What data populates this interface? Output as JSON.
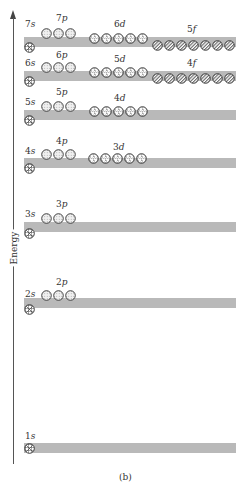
{
  "axis": {
    "label": "Energy",
    "arrow": "arrow-up-icon"
  },
  "caption": "(b)",
  "colors": {
    "band": "#b9b9b9",
    "stroke": "#333333",
    "axis": "#555555"
  },
  "shells": [
    {
      "n": 7,
      "band_top": 37,
      "subshells": [
        {
          "name": "7s",
          "n": "7",
          "l": "s",
          "count": 1,
          "x": 24,
          "y": 42,
          "label_x": 25,
          "label_y": 20
        },
        {
          "name": "7p",
          "n": "7",
          "l": "p",
          "count": 3,
          "x": 41,
          "y": 28,
          "label_x": 56,
          "label_y": 14
        },
        {
          "name": "6d",
          "n": "6",
          "l": "d",
          "count": 5,
          "x": 89,
          "y": 33,
          "label_x": 114,
          "label_y": 20
        },
        {
          "name": "5f",
          "n": "5",
          "l": "f",
          "count": 7,
          "x": 152,
          "y": 40,
          "label_x": 187,
          "label_y": 25
        }
      ]
    },
    {
      "n": 6,
      "band_top": 71,
      "subshells": [
        {
          "name": "6s",
          "n": "6",
          "l": "s",
          "count": 1,
          "x": 24,
          "y": 76,
          "label_x": 25,
          "label_y": 59
        },
        {
          "name": "6p",
          "n": "6",
          "l": "p",
          "count": 3,
          "x": 41,
          "y": 62,
          "label_x": 56,
          "label_y": 51
        },
        {
          "name": "5d",
          "n": "5",
          "l": "d",
          "count": 5,
          "x": 89,
          "y": 67,
          "label_x": 114,
          "label_y": 55
        },
        {
          "name": "4f",
          "n": "4",
          "l": "f",
          "count": 7,
          "x": 152,
          "y": 73,
          "label_x": 187,
          "label_y": 59
        }
      ]
    },
    {
      "n": 5,
      "band_top": 110,
      "subshells": [
        {
          "name": "5s",
          "n": "5",
          "l": "s",
          "count": 1,
          "x": 24,
          "y": 115,
          "label_x": 25,
          "label_y": 98
        },
        {
          "name": "5p",
          "n": "5",
          "l": "p",
          "count": 3,
          "x": 41,
          "y": 101,
          "label_x": 56,
          "label_y": 88
        },
        {
          "name": "4d",
          "n": "4",
          "l": "d",
          "count": 5,
          "x": 89,
          "y": 106,
          "label_x": 114,
          "label_y": 94
        }
      ]
    },
    {
      "n": 4,
      "band_top": 158,
      "subshells": [
        {
          "name": "4s",
          "n": "4",
          "l": "s",
          "count": 1,
          "x": 24,
          "y": 163,
          "label_x": 25,
          "label_y": 147
        },
        {
          "name": "4p",
          "n": "4",
          "l": "p",
          "count": 3,
          "x": 41,
          "y": 149,
          "label_x": 56,
          "label_y": 137
        },
        {
          "name": "3d",
          "n": "3",
          "l": "d",
          "count": 5,
          "x": 88,
          "y": 153,
          "label_x": 113,
          "label_y": 143
        }
      ]
    },
    {
      "n": 3,
      "band_top": 222,
      "subshells": [
        {
          "name": "3s",
          "n": "3",
          "l": "s",
          "count": 1,
          "x": 24,
          "y": 228,
          "label_x": 25,
          "label_y": 210
        },
        {
          "name": "3p",
          "n": "3",
          "l": "p",
          "count": 3,
          "x": 41,
          "y": 213,
          "label_x": 56,
          "label_y": 200
        }
      ]
    },
    {
      "n": 2,
      "band_top": 298,
      "subshells": [
        {
          "name": "2s",
          "n": "2",
          "l": "s",
          "count": 1,
          "x": 24,
          "y": 304,
          "label_x": 25,
          "label_y": 290
        },
        {
          "name": "2p",
          "n": "2",
          "l": "p",
          "count": 3,
          "x": 41,
          "y": 290,
          "label_x": 56,
          "label_y": 278
        }
      ]
    },
    {
      "n": 1,
      "band_top": 443,
      "subshells": [
        {
          "name": "1s",
          "n": "1",
          "l": "s",
          "count": 1,
          "x": 24,
          "y": 443,
          "label_x": 25,
          "label_y": 432
        }
      ]
    }
  ],
  "band": {
    "left": 24,
    "right": 236,
    "height": 10
  }
}
